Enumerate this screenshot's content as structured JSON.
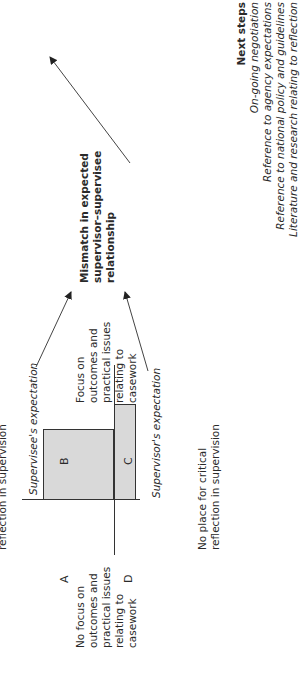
{
  "diagram": {
    "top_axis_label": "reflection in supervision",
    "bottom_axis_label": [
      "No place for critical",
      "reflection in supervision"
    ],
    "left_axis_label": [
      "No focus on",
      "outcomes and",
      "practical issues",
      "relating to",
      "casework"
    ],
    "right_axis_label": [
      "Focus on",
      "outcomes and",
      "practical issues",
      "relating to",
      "casework"
    ],
    "quadrants": {
      "A": "A",
      "B": "B",
      "C": "C",
      "D": "D"
    },
    "supervisee_expectation": "Supervisee's expectation",
    "supervisor_expectation": "Supervisor's expectation",
    "mismatch": [
      "Mismatch in expected",
      "supervisor–supervisee",
      "relationship"
    ],
    "next_steps": {
      "title": "Next steps",
      "items": [
        "On-going negotiation",
        "Reference to agency expectations",
        "Reference to national policy and guidelines",
        "Literature and research relating to reflection"
      ]
    },
    "colors": {
      "box_fill": "#d9d9d9",
      "line": "#333333",
      "text": "#2a2a2a"
    }
  }
}
